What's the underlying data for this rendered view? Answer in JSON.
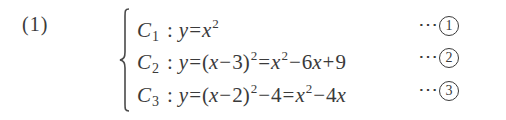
{
  "problem": {
    "number_label": "(1)"
  },
  "system": {
    "equations": [
      {
        "curve": "C",
        "curve_index": "1",
        "colon": ":",
        "lhs": "y",
        "eq": "=",
        "forms": [
          {
            "parts": [
              {
                "t": "var",
                "v": "x"
              },
              {
                "t": "sup",
                "v": "2"
              }
            ]
          }
        ],
        "marker_dots": "⋯",
        "marker_number": "1",
        "text": "C1 : y=x^2"
      },
      {
        "curve": "C",
        "curve_index": "2",
        "colon": ":",
        "lhs": "y",
        "eq": "=",
        "form1": "(x−3)²",
        "form2": "x²−6x+9",
        "marker_dots": "⋯",
        "marker_number": "2",
        "text": "C2 : y=(x-3)^2=x^2-6x+9"
      },
      {
        "curve": "C",
        "curve_index": "3",
        "colon": ":",
        "lhs": "y",
        "eq": "=",
        "form1": "(x−2)²−4",
        "form2": "x²−4x",
        "marker_dots": "⋯",
        "marker_number": "3",
        "text": "C3 : y=(x-2)^2-4=x^2-4x"
      }
    ],
    "tokens": {
      "x": "x",
      "sq": "2",
      "minus": "−",
      "plus": "+",
      "lparen": "(",
      "rparen": ")",
      "three": "3",
      "two": "2",
      "four": "4",
      "six": "6",
      "nine": "9"
    }
  },
  "colors": {
    "text": "#3a3a3a",
    "background": "#ffffff"
  }
}
